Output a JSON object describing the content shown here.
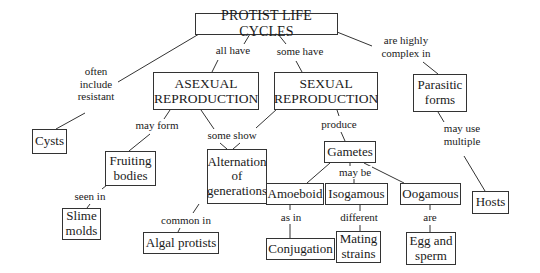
{
  "diagram": {
    "type": "concept-map",
    "title": "PROTIST LIFE CYCLES",
    "nodes": {
      "root": "PROTIST LIFE CYCLES",
      "asexual": "ASEXUAL\nREPRODUCTION",
      "sexual": "SEXUAL\nREPRODUCTION",
      "parasitic": "Parasitic\nforms",
      "cysts": "Cysts",
      "fruiting": "Fruiting\nbodies",
      "alternation": "Alternation\nof\ngenerations",
      "gametes": "Gametes",
      "amoeboid": "Amoeboid",
      "isogamous": "Isogamous",
      "oogamous": "Oogamous",
      "hosts": "Hosts",
      "slime": "Slime\nmolds",
      "algal": "Algal protists",
      "conjugation": "Conjugation",
      "mating": "Mating\nstrains",
      "egg": "Egg and\nsperm"
    },
    "links": {
      "root_cysts": "often\ninclude\nresistant",
      "root_asexual": "all have",
      "root_sexual": "some have",
      "root_parasitic": "are highly\ncomplex in",
      "asexual_fruiting": "may form",
      "alt_show": "some show",
      "sexual_gametes": "produce",
      "parasitic_hosts": "may use\nmultiple",
      "fruiting_slime": "seen in",
      "alt_algal": "common in",
      "gametes_types": "may be",
      "amoeboid_conj": "as in",
      "iso_mating": "different",
      "oo_egg": "are"
    }
  }
}
